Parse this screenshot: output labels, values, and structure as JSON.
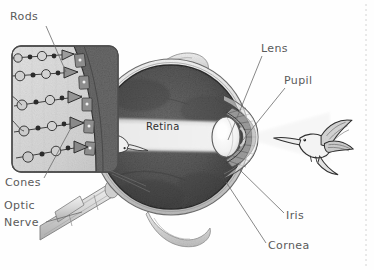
{
  "figure": {
    "kind": "anatomical-illustration",
    "background_color": "#fefefe",
    "label_color": "#5a5a5a",
    "leader_color": "#6a6a6a"
  },
  "labels": {
    "rods": "Rods",
    "cones": "Cones",
    "optic_nerve_line1": "Optic",
    "optic_nerve_line2": "Nerve",
    "retina": "Retina",
    "lens": "Lens",
    "pupil": "Pupil",
    "iris": "Iris",
    "cornea": "Cornea"
  },
  "parts": {
    "eyeball": {
      "name": "eyeball",
      "fill": "#5d5d5d"
    },
    "vitreous": {
      "name": "vitreous-chamber",
      "fill": "#4a4a4a"
    },
    "light_cone": {
      "name": "light-cone",
      "fill": "#e8e8e8"
    },
    "lens_body": {
      "name": "lens",
      "fill": "#f4f4f4"
    },
    "iris_body": {
      "name": "iris",
      "fill": "#9a9a9a"
    },
    "cornea_body": {
      "name": "cornea",
      "fill": "#efefef"
    },
    "sclera": {
      "name": "sclera",
      "fill": "#dcdcdc"
    },
    "optic_nerve_body": {
      "name": "optic-nerve",
      "fill": "#dedede"
    },
    "muscle_top": {
      "name": "eye-muscle-superior",
      "fill": "#d4d4d4"
    },
    "muscle_bottom": {
      "name": "eye-muscle-inferior",
      "fill": "#cfcfcf"
    },
    "inset_panel": {
      "name": "retina-detail-inset",
      "fill": "#d9d9d9"
    },
    "pigment_band": {
      "name": "pigment-epithelium-band",
      "fill": "#6e6e6e"
    },
    "hummingbird_outside": {
      "name": "hummingbird-subject",
      "fill": "#f0f0f0"
    },
    "hummingbird_retina": {
      "name": "hummingbird-inverted-image",
      "fill": "#e6e6e6"
    }
  },
  "inset": {
    "neuron_chains": 5,
    "receptor_type_top": "rod",
    "receptor_type_bottom": "cone"
  }
}
